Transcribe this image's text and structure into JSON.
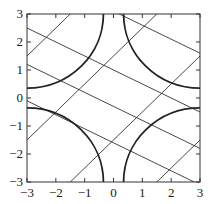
{
  "chart_data": {
    "type": "line",
    "title": "",
    "xlabel": "",
    "ylabel": "",
    "xlim": [
      -3,
      3
    ],
    "ylim": [
      -3,
      3
    ],
    "xticks": [
      "-3",
      "-2",
      "-1",
      "0",
      "1",
      "2",
      "3"
    ],
    "yticks": [
      "-3",
      "-2",
      "-1",
      "0",
      "1",
      "2",
      "3"
    ],
    "grid": false,
    "series": [
      {
        "name": "lines-positive-slope",
        "slope": 1,
        "intercepts": [
          4.5,
          1.5,
          -1.5,
          -4.5
        ]
      },
      {
        "name": "lines-negative-slope",
        "slope": -0.5,
        "intercepts": [
          3.1,
          1.0,
          -0.3,
          -1.6
        ]
      },
      {
        "name": "quarter-circle-arcs",
        "radius": 2.65,
        "centers": [
          [
            -3,
            3
          ],
          [
            3,
            3
          ],
          [
            -3,
            -3
          ],
          [
            3,
            -3
          ]
        ]
      }
    ]
  }
}
